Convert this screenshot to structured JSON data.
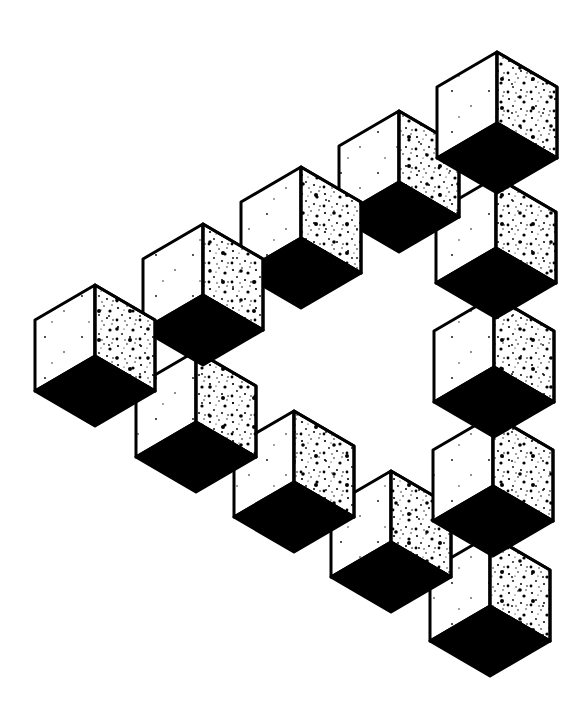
{
  "colors": {
    "ink": "#000000",
    "paper": "#ffffff"
  },
  "cube": {
    "half_width": 60,
    "rise": 35,
    "height": 71
  },
  "cubes_draw_order": [
    {
      "id": "right-5",
      "x": 490,
      "y": 535
    },
    {
      "id": "bottom-3",
      "x": 391,
      "y": 471
    },
    {
      "id": "bottom-2",
      "x": 294,
      "y": 411
    },
    {
      "id": "bottom-1",
      "x": 196,
      "y": 351
    },
    {
      "id": "right-4",
      "x": 493,
      "y": 415
    },
    {
      "id": "right-3",
      "x": 494,
      "y": 296
    },
    {
      "id": "right-2",
      "x": 496,
      "y": 177
    },
    {
      "id": "top-4",
      "x": 399,
      "y": 111
    },
    {
      "id": "right-1",
      "x": 497,
      "y": 52
    },
    {
      "id": "top-3",
      "x": 301,
      "y": 167
    },
    {
      "id": "top-2",
      "x": 203,
      "y": 224
    },
    {
      "id": "top-1",
      "x": 95,
      "y": 285
    }
  ]
}
